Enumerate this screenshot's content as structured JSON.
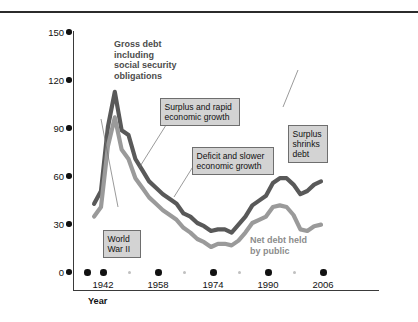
{
  "page": {
    "header_faint_text": "",
    "header_rule_color": "#2b2b2b"
  },
  "figure": {
    "background": "#ffffff"
  },
  "chart_data": {
    "type": "line",
    "title": "",
    "xlabel": "Year",
    "ylabel": "Federal government debt (percentage of GDP)",
    "xlim": [
      1938,
      2010
    ],
    "ylim": [
      0,
      150
    ],
    "grid": false,
    "legend_position": "inline-annotation",
    "xticks_major": [
      1942,
      1958,
      1974,
      1990,
      2006
    ],
    "xtick_labels": [
      "1942",
      "1958",
      "1974",
      "1990",
      "2006"
    ],
    "xticks_minor": [
      1950,
      1966,
      1982,
      1998
    ],
    "yticks": [
      0,
      30,
      60,
      90,
      120,
      150
    ],
    "ytick_labels": [
      "0",
      "30",
      "60",
      "90",
      "120",
      "150"
    ],
    "series": [
      {
        "name": "Gross debt including social security obligations",
        "color": "#595959",
        "x": [
          1940,
          1942,
          1944,
          1946,
          1947,
          1948,
          1950,
          1952,
          1954,
          1956,
          1958,
          1960,
          1962,
          1964,
          1966,
          1968,
          1970,
          1972,
          1974,
          1976,
          1978,
          1980,
          1982,
          1984,
          1986,
          1988,
          1990,
          1992,
          1994,
          1996,
          1998,
          2000,
          2002,
          2004,
          2006
        ],
        "values": [
          52,
          60,
          100,
          122,
          110,
          98,
          95,
          80,
          73,
          66,
          62,
          58,
          55,
          52,
          46,
          44,
          40,
          38,
          35,
          36,
          36,
          34,
          39,
          44,
          51,
          54,
          57,
          65,
          68,
          68,
          64,
          58,
          60,
          64,
          66
        ]
      },
      {
        "name": "Net debt held by public",
        "color": "#9a9a9a",
        "x": [
          1940,
          1942,
          1944,
          1946,
          1947,
          1948,
          1950,
          1952,
          1954,
          1956,
          1958,
          1960,
          1962,
          1964,
          1966,
          1968,
          1970,
          1972,
          1974,
          1976,
          1978,
          1980,
          1982,
          1984,
          1986,
          1988,
          1990,
          1992,
          1994,
          1996,
          1998,
          2000,
          2002,
          2004,
          2006
        ],
        "values": [
          44,
          50,
          88,
          106,
          96,
          86,
          80,
          68,
          62,
          56,
          52,
          48,
          45,
          42,
          37,
          34,
          30,
          28,
          25,
          27,
          27,
          26,
          29,
          34,
          40,
          42,
          44,
          50,
          51,
          50,
          45,
          36,
          35,
          38,
          39
        ]
      }
    ],
    "annotations": [
      {
        "id": "gross-debt",
        "style": "inline-label",
        "text": "Gross debt\nincluding\nsocial security\nobligations",
        "color": "#4c4c4c"
      },
      {
        "id": "net-debt",
        "style": "inline-label",
        "text": "Net debt held\nby public",
        "color": "#8c8c8c"
      },
      {
        "id": "world-war-ii",
        "style": "callout-box",
        "text": "World\nWar II"
      },
      {
        "id": "surplus-rapid-growth",
        "style": "callout-box",
        "text": "Surplus and rapid\neconomic growth"
      },
      {
        "id": "deficit-slower-growth",
        "style": "callout-box",
        "text": "Deficit and slower\neconomic growth"
      },
      {
        "id": "surplus-shrinks-debt",
        "style": "callout-box",
        "text": "Surplus\nshrinks\ndebt"
      }
    ]
  }
}
